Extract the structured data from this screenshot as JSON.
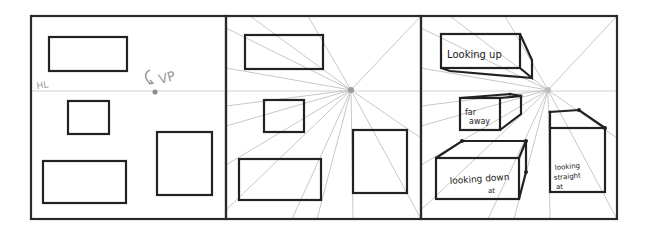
{
  "figure": {
    "panels": [
      {
        "id": "panel-1",
        "title": "Horizon line and vanishing point",
        "labels": {
          "horizon": "HL",
          "vanishing_point": "VP"
        }
      },
      {
        "id": "panel-2",
        "title": "Guide lines to vanishing point"
      },
      {
        "id": "panel-3",
        "title": "Extruded boxes",
        "labels": {
          "top_left": "Looking up",
          "middle": [
            "far",
            "away"
          ],
          "bottom_left": [
            "looking down",
            "at"
          ],
          "right": [
            "looking",
            "straight",
            "at"
          ]
        }
      }
    ],
    "colors": {
      "ink": "#222222",
      "guide": "#c8c8c8",
      "vp": "#9a9a9a"
    }
  }
}
